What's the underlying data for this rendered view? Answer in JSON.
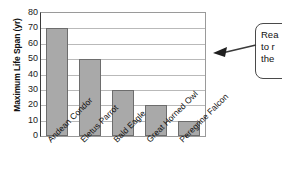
{
  "chart_data": {
    "type": "bar",
    "title": "Maximum Life Span",
    "title_fragment": "p",
    "xlabel": "",
    "ylabel": "Maximum Life Span (yr)",
    "categories": [
      "Andean Condor",
      "Eletus Parrot",
      "Bald Eagle",
      "Great Horned Owl",
      "Peregrine Falcon"
    ],
    "values": [
      70,
      50,
      30,
      20,
      10
    ],
    "ylim": [
      0,
      80
    ],
    "ytick_labels": [
      "80",
      "70",
      "60",
      "50",
      "40",
      "30",
      "20",
      "10",
      "0"
    ],
    "ytick_values": [
      80,
      70,
      60,
      50,
      40,
      30,
      20,
      10,
      0
    ],
    "ytick_step": 10,
    "grid": true,
    "legend": false,
    "legend_position": "none",
    "bar_fill_color": "#a9a9a9",
    "bar_edge_color": "#6d6d6d",
    "gridline_color": "#b9b9b9",
    "axis_color": "#3a3a3a"
  },
  "callout": {
    "lines": [
      "Rea",
      "to r",
      "the"
    ],
    "arrow_direction": "left",
    "border_color": "#4a4a4a"
  }
}
